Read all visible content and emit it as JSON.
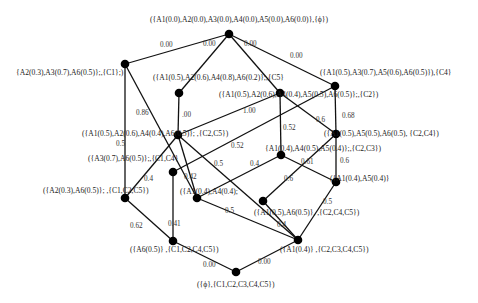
{
  "diagram": {
    "type": "concept-lattice",
    "nodes": [
      {
        "id": "n0",
        "x": 229,
        "y": 34,
        "label": "({A1(0.0),A2(0.0),A3(0.0),A4(0.0),A5(0.0),A6(0.0)},{ϕ})",
        "lx": 150,
        "ly": 22
      },
      {
        "id": "n1",
        "x": 125,
        "y": 64,
        "label": "{A2(0.3),A3(0.7),A6(0.5)};,{C1};)",
        "lx": 16,
        "ly": 75
      },
      {
        "id": "n2",
        "x": 179,
        "y": 93,
        "label": "({A1(0.5),A2(0.6),A4(0.8),A6(0.2)};,{C5}",
        "lx": 153,
        "ly": 80
      },
      {
        "id": "n3",
        "x": 280,
        "y": 93,
        "label": "({A1(0.5),A2(0.6),A4(0.4),A5(0.5),A6(0.5)};,{C2})",
        "lx": 219,
        "ly": 97
      },
      {
        "id": "n4",
        "x": 335,
        "y": 86,
        "label": "({A1(0.5),A3(0.7),A5(0.6),A6(0.5)}),{C4}",
        "lx": 320,
        "ly": 75
      },
      {
        "id": "n5",
        "x": 178,
        "y": 135,
        "label": "({A1(0.5),A2(0.6),A4(0.4),A6(0.5)}; ,{C2,C5})",
        "lx": 82,
        "ly": 136
      },
      {
        "id": "n6",
        "x": 336,
        "y": 134,
        "label": "({A1(0.5),A5(0.5),A6(0.5), {C2,C4})",
        "lx": 324,
        "ly": 136
      },
      {
        "id": "n7",
        "x": 281,
        "y": 155,
        "label": "{A1(0.4),A4(0.5),A5(0.4)};,{C2,C3})",
        "lx": 265,
        "ly": 151
      },
      {
        "id": "n8",
        "x": 173,
        "y": 172,
        "label": "({A3(0.7),A6(0.5)};,{C1,C4}",
        "lx": 88,
        "ly": 161
      },
      {
        "id": "n9",
        "x": 125,
        "y": 198,
        "label": "({A2(0.3),A6(0.5)}; ,{C1,C2,C5})",
        "lx": 43,
        "ly": 193
      },
      {
        "id": "n10",
        "x": 197,
        "y": 198,
        "label": "({A1(0.4),A4(0.4);",
        "lx": 180,
        "ly": 194
      },
      {
        "id": "n11",
        "x": 263,
        "y": 201,
        "label": "({A1(0.5),A6(0.5)}, ,{C2,C4,C5})",
        "lx": 254,
        "ly": 215
      },
      {
        "id": "n12",
        "x": 336,
        "y": 182,
        "label": "({A1(0.4),A5(0.4)}",
        "lx": 330,
        "ly": 181
      },
      {
        "id": "n13",
        "x": 298,
        "y": 240,
        "label": "({A1(0.4)} ,{C2,C3,C4,C5})",
        "lx": 280,
        "ly": 252
      },
      {
        "id": "n14",
        "x": 173,
        "y": 241,
        "label": "({A6(0.5)} ,{C1,C2,C4,C5})",
        "lx": 130,
        "ly": 252
      },
      {
        "id": "n15",
        "x": 236,
        "y": 272,
        "label": "({ϕ},{C1,C2,C3,C4,C5})",
        "lx": 197,
        "ly": 287
      }
    ],
    "edges": [
      {
        "from": "n0",
        "to": "n1",
        "label": "0.00",
        "lx": 160,
        "ly": 47
      },
      {
        "from": "n0",
        "to": "n2",
        "label": "0.00",
        "lx": 203,
        "ly": 46
      },
      {
        "from": "n0",
        "to": "n3",
        "label": "0.00",
        "lx": 244,
        "ly": 46
      },
      {
        "from": "n0",
        "to": "n4",
        "label": "0.00",
        "lx": 290,
        "ly": 58
      },
      {
        "from": "n1",
        "to": "n9",
        "label": "0.5",
        "lx": 116,
        "ly": 146
      },
      {
        "from": "n1",
        "to": "n10",
        "label": "0.86",
        "lx": 136,
        "ly": 115
      },
      {
        "from": "n2",
        "to": "n5",
        "label": ".00",
        "lx": 182,
        "ly": 117
      },
      {
        "from": "n3",
        "to": "n5",
        "label": "1.00",
        "lx": 243,
        "ly": 113
      },
      {
        "from": "n3",
        "to": "n7",
        "label": "0.52",
        "lx": 283,
        "ly": 130
      },
      {
        "from": "n3",
        "to": "n6",
        "label": "0.6",
        "lx": 316,
        "ly": 122
      },
      {
        "from": "n4",
        "to": "n6",
        "label": "0.68",
        "lx": 342,
        "ly": 118
      },
      {
        "from": "n4",
        "to": "n8",
        "label": "0.52",
        "lx": 231,
        "ly": 148
      },
      {
        "from": "n5",
        "to": "n9",
        "label": "0.4",
        "lx": 144,
        "ly": 181
      },
      {
        "from": "n5",
        "to": "n10",
        "label": "0.42",
        "lx": 184,
        "ly": 179
      },
      {
        "from": "n5",
        "to": "n13",
        "label": "0.5",
        "lx": 214,
        "ly": 166
      },
      {
        "from": "n6",
        "to": "n12",
        "label": "0.6",
        "lx": 340,
        "ly": 163
      },
      {
        "from": "n6",
        "to": "n11",
        "label": "0.6",
        "lx": 284,
        "ly": 181
      },
      {
        "from": "n7",
        "to": "n10",
        "label": "0.4",
        "lx": 250,
        "ly": 166
      },
      {
        "from": "n7",
        "to": "n12",
        "label": "0.61",
        "lx": 301,
        "ly": 164
      },
      {
        "from": "n8",
        "to": "n14",
        "label": "0.41",
        "lx": 168,
        "ly": 226
      },
      {
        "from": "n9",
        "to": "n14",
        "label": "0.62",
        "lx": 130,
        "ly": 228
      },
      {
        "from": "n10",
        "to": "n13",
        "label": "0.5",
        "lx": 225,
        "ly": 213
      },
      {
        "from": "n11",
        "to": "n13",
        "label": "0.4",
        "lx": 277,
        "ly": 227
      },
      {
        "from": "n12",
        "to": "n13",
        "label": "0.5",
        "lx": 323,
        "ly": 204
      },
      {
        "from": "n14",
        "to": "n15",
        "label": "0.00",
        "lx": 203,
        "ly": 267
      },
      {
        "from": "n13",
        "to": "n15",
        "label": "0.00",
        "lx": 258,
        "ly": 264
      }
    ]
  }
}
